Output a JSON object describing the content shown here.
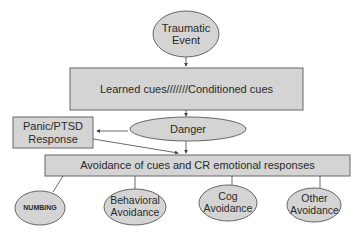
{
  "diagram": {
    "nodes": {
      "traumatic_event": {
        "line1": "Traumatic",
        "line2": "Event",
        "shape": "ellipse"
      },
      "learned_cues": {
        "label": "Learned cues///////Conditioned cues",
        "shape": "rect"
      },
      "danger": {
        "label": "Danger",
        "shape": "ellipse"
      },
      "panic_response": {
        "line1": "Panic/PTSD",
        "line2": "Response",
        "shape": "rect"
      },
      "avoidance": {
        "label": "Avoidance of cues and CR emotional responses",
        "shape": "rect"
      },
      "numbing": {
        "label": "NUMBING",
        "shape": "ellipse"
      },
      "behavioral_avoidance": {
        "line1": "Behavioral",
        "line2": "Avoidance",
        "shape": "ellipse"
      },
      "cog_avoidance": {
        "line1": "Cog",
        "line2": "Avoidance",
        "shape": "ellipse"
      },
      "other_avoidance": {
        "line1": "Other",
        "line2": "Avoidance",
        "shape": "ellipse"
      }
    },
    "edges": [
      {
        "from": "traumatic_event",
        "to": "learned_cues"
      },
      {
        "from": "learned_cues",
        "to": "danger"
      },
      {
        "from": "danger",
        "to": "panic_response"
      },
      {
        "from": "danger",
        "to": "avoidance"
      },
      {
        "from": "panic_response",
        "to": "avoidance"
      },
      {
        "from": "avoidance",
        "to": "numbing"
      },
      {
        "from": "avoidance",
        "to": "behavioral_avoidance"
      },
      {
        "from": "avoidance",
        "to": "cog_avoidance"
      },
      {
        "from": "avoidance",
        "to": "other_avoidance"
      }
    ],
    "colors": {
      "fill": "#d4d4d4",
      "stroke": "#555555",
      "line": "#444444"
    }
  }
}
